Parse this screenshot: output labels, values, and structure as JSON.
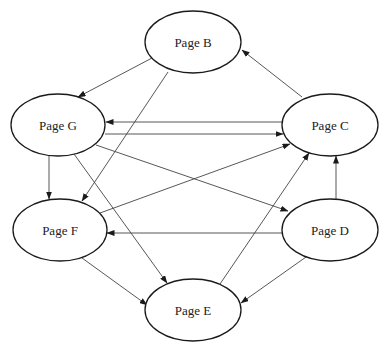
{
  "diagram": {
    "type": "directed-graph",
    "colors": {
      "stroke": "#1a1a1a",
      "edge": "#444444",
      "text": "#222222",
      "background": "#ffffff"
    },
    "nodes": [
      {
        "id": "B",
        "label": "Page B",
        "cx": 193,
        "cy": 42,
        "rx": 48,
        "ry": 31
      },
      {
        "id": "G",
        "label": "Page G",
        "cx": 58,
        "cy": 125,
        "rx": 47,
        "ry": 31
      },
      {
        "id": "C",
        "label": "Page C",
        "cx": 330,
        "cy": 125,
        "rx": 48,
        "ry": 31
      },
      {
        "id": "F",
        "label": "Page F",
        "cx": 60,
        "cy": 230,
        "rx": 47,
        "ry": 31
      },
      {
        "id": "D",
        "label": "Page D",
        "cx": 330,
        "cy": 230,
        "rx": 48,
        "ry": 31
      },
      {
        "id": "E",
        "label": "Page E",
        "cx": 193,
        "cy": 310,
        "rx": 48,
        "ry": 31
      }
    ],
    "edges": [
      {
        "from": "B",
        "to": "G",
        "x1": 152,
        "y1": 58,
        "x2": 78,
        "y2": 97
      },
      {
        "from": "C",
        "to": "B",
        "x1": 302,
        "y1": 97,
        "x2": 242,
        "y2": 50
      },
      {
        "from": "C",
        "to": "G",
        "x1": 282,
        "y1": 122,
        "x2": 106,
        "y2": 122
      },
      {
        "from": "G",
        "to": "C",
        "x1": 105,
        "y1": 134,
        "x2": 283,
        "y2": 134
      },
      {
        "from": "G",
        "to": "F",
        "x1": 49,
        "y1": 156,
        "x2": 49,
        "y2": 199
      },
      {
        "from": "B",
        "to": "F",
        "x1": 168,
        "y1": 72,
        "x2": 82,
        "y2": 201
      },
      {
        "from": "G",
        "to": "D",
        "x1": 96,
        "y1": 145,
        "x2": 288,
        "y2": 211
      },
      {
        "from": "G",
        "to": "E",
        "x1": 74,
        "y1": 154,
        "x2": 167,
        "y2": 283
      },
      {
        "from": "F",
        "to": "C",
        "x1": 100,
        "y1": 213,
        "x2": 290,
        "y2": 144
      },
      {
        "from": "D",
        "to": "F",
        "x1": 282,
        "y1": 233,
        "x2": 107,
        "y2": 233
      },
      {
        "from": "D",
        "to": "C",
        "x1": 336,
        "y1": 199,
        "x2": 336,
        "y2": 156
      },
      {
        "from": "F",
        "to": "E",
        "x1": 82,
        "y1": 258,
        "x2": 147,
        "y2": 305
      },
      {
        "from": "E",
        "to": "C",
        "x1": 220,
        "y1": 284,
        "x2": 309,
        "y2": 153
      },
      {
        "from": "D",
        "to": "E",
        "x1": 306,
        "y1": 257,
        "x2": 241,
        "y2": 303
      }
    ]
  }
}
